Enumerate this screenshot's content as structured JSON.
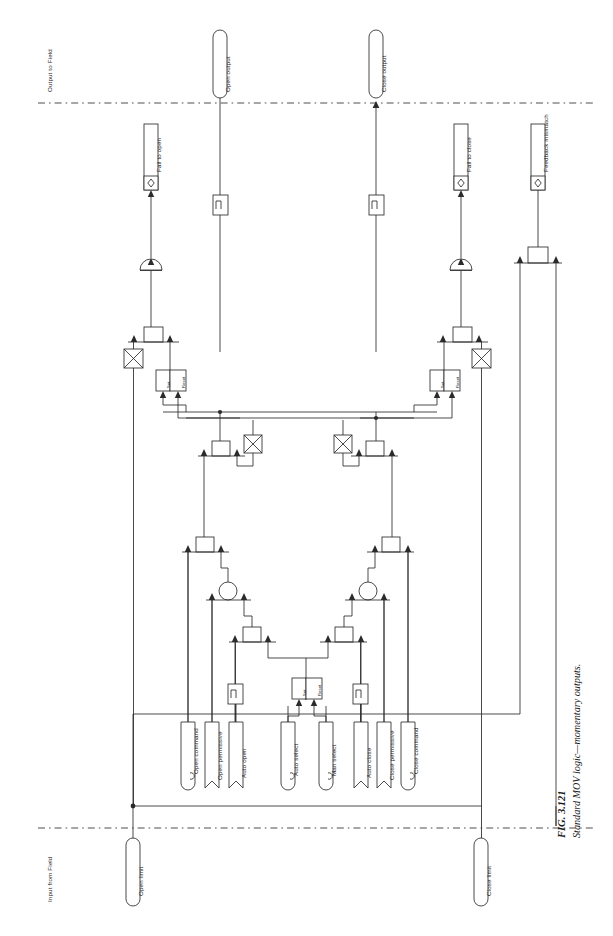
{
  "figure": {
    "number": "FIG. 3.121",
    "caption": "Standard MOV logic—momentary outputs."
  },
  "zones": {
    "output": "Output to Field",
    "input": "Input from Field"
  },
  "outputs_to_field": [
    {
      "name": "open-output",
      "label": "Open output",
      "shape": "rounded-terminal"
    },
    {
      "name": "close-output",
      "label": "Close output",
      "shape": "rounded-terminal"
    }
  ],
  "inputs_from_field": [
    {
      "name": "open-limit",
      "label": "Open limit",
      "shape": "rounded-terminal"
    },
    {
      "name": "close-limit",
      "label": "Close limit",
      "shape": "rounded-terminal"
    }
  ],
  "alarms": [
    {
      "name": "fail-to-open",
      "label": "Fail to open",
      "icon": "diamond-alarm-icon"
    },
    {
      "name": "fail-to-close",
      "label": "Fail to close",
      "icon": "diamond-alarm-icon"
    },
    {
      "name": "feedback-mismatch",
      "label": "Feedback mismatch",
      "icon": "diamond-alarm-icon"
    }
  ],
  "operator_inputs": [
    {
      "name": "open-permissive",
      "label": "Open permissive",
      "marker": "flag"
    },
    {
      "name": "open-command",
      "label": "Open command",
      "marker": "c-tag"
    },
    {
      "name": "auto-open",
      "label": "Auto open",
      "marker": "flag"
    },
    {
      "name": "auto-select",
      "label": "Auto select",
      "marker": "c-tag"
    },
    {
      "name": "man-select",
      "label": "Man select",
      "marker": "c-tag"
    },
    {
      "name": "auto-close",
      "label": "Auto close",
      "marker": "flag"
    },
    {
      "name": "close-command",
      "label": "Close command",
      "marker": "c-tag"
    },
    {
      "name": "close-permissive",
      "label": "Close permissive",
      "marker": "flag"
    }
  ],
  "blocks": {
    "set_label": "Set",
    "reset_label": "Reset",
    "pulse_label": "⌐",
    "and_gate": "AND",
    "or_gate": "OR",
    "xor_gate": "XOR",
    "timer_gate": "Timer"
  },
  "colors": {
    "line": "#2b2b2b",
    "fill": "#ffffff",
    "text": "#1a1a1a",
    "dash": "#3a3a3a"
  }
}
